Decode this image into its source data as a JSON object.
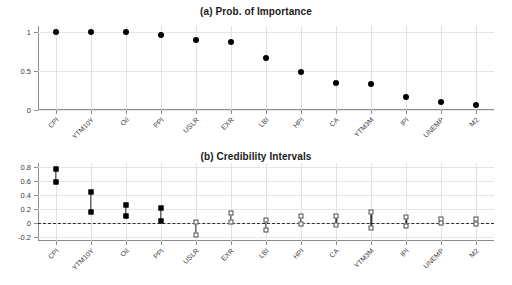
{
  "figure": {
    "background": "#ffffff",
    "marker_color": "#000000"
  },
  "panels": [
    {
      "id": "a",
      "title": "(a) Prob. of Importance"
    },
    {
      "id": "b",
      "title": "(b) Credibility Intervals"
    }
  ],
  "chart_data": [
    {
      "type": "scatter",
      "title": "(a) Prob. of Importance",
      "xlabel": "",
      "ylabel": "",
      "categories": [
        "CPI",
        "YTM10Y",
        "Oil",
        "PPI",
        "USLR",
        "EXR",
        "LBI",
        "HPI",
        "CA",
        "YTM3M",
        "IPI",
        "UNEMP",
        "M2"
      ],
      "values": [
        1.0,
        1.0,
        1.0,
        0.96,
        0.9,
        0.88,
        0.67,
        0.49,
        0.35,
        0.34,
        0.17,
        0.1,
        0.07
      ],
      "ylim": [
        0,
        1.08
      ],
      "yticks": [
        0,
        0.5,
        1
      ],
      "yticklabels": [
        "0",
        "0.5",
        "1"
      ],
      "grid": true,
      "legend": "none"
    },
    {
      "type": "scatter",
      "title": "(b) Credibility Intervals",
      "xlabel": "",
      "ylabel": "",
      "categories": [
        "CPI",
        "YTM10Y",
        "Oil",
        "PPI",
        "USLR",
        "EXR",
        "LBI",
        "HPI",
        "CA",
        "YTM3M",
        "IPI",
        "UNEMP",
        "M2"
      ],
      "upper": [
        0.77,
        0.44,
        0.26,
        0.22,
        0.01,
        0.14,
        0.04,
        0.1,
        0.1,
        0.15,
        0.08,
        0.06,
        0.06
      ],
      "lower": [
        0.59,
        0.15,
        0.1,
        0.03,
        -0.18,
        0.01,
        -0.1,
        -0.02,
        -0.03,
        -0.08,
        -0.04,
        0.0,
        -0.02
      ],
      "significant": [
        true,
        true,
        true,
        true,
        false,
        false,
        false,
        false,
        false,
        false,
        false,
        false,
        false
      ],
      "zero_reference": 0,
      "ylim": [
        -0.26,
        0.86
      ],
      "yticks": [
        -0.2,
        0,
        0.2,
        0.4,
        0.6,
        0.8
      ],
      "yticklabels": [
        "-0.2",
        "0",
        "0.2",
        "0.4",
        "0.6",
        "0.8"
      ],
      "grid": true,
      "legend": "none"
    }
  ]
}
